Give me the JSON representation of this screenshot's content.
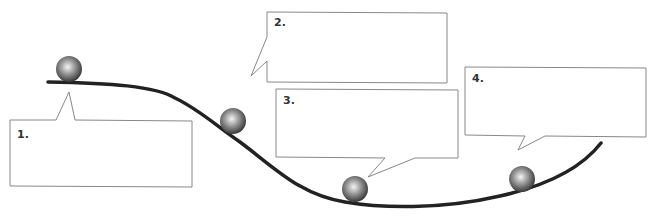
{
  "diagram": {
    "type": "ball-on-track-energy-diagram",
    "callouts": [
      {
        "id": 1,
        "label": "1.",
        "text": ""
      },
      {
        "id": 2,
        "label": "2.",
        "text": ""
      },
      {
        "id": 3,
        "label": "3.",
        "text": ""
      },
      {
        "id": 4,
        "label": "4.",
        "text": ""
      }
    ],
    "balls": [
      {
        "id": 1,
        "position": "top of hill"
      },
      {
        "id": 2,
        "position": "on slope"
      },
      {
        "id": 3,
        "position": "bottom of valley"
      },
      {
        "id": 4,
        "position": "rising slope"
      }
    ],
    "colors": {
      "track": "#222222",
      "box_border": "#888888",
      "ball_highlight": "#f5f5f5",
      "ball_shadow": "#333333"
    }
  }
}
